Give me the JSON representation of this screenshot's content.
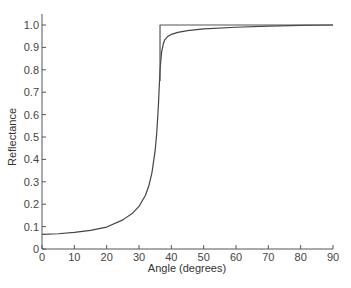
{
  "chart_data": {
    "type": "line",
    "title": "",
    "xlabel": "Angle (degrees)",
    "ylabel": "Reflectance",
    "xlim": [
      0,
      90
    ],
    "ylim": [
      0,
      1.05
    ],
    "grid": false,
    "legend": null,
    "x_ticks": [
      "0",
      "10",
      "20",
      "30",
      "40",
      "50",
      "60",
      "70",
      "80",
      "90"
    ],
    "y_ticks": [
      "0",
      "0.1",
      "0.2",
      "0.3",
      "0.4",
      "0.5",
      "0.6",
      "0.7",
      "0.8",
      "0.9",
      "1.0"
    ],
    "series": [
      {
        "name": "Reflectance (smooth)",
        "color": "#444444",
        "x": [
          0,
          5,
          10,
          15,
          20,
          25,
          28,
          30,
          32,
          33,
          34,
          35,
          35.5,
          36,
          36.5,
          37,
          37.5,
          38,
          39,
          40,
          42,
          45,
          50,
          60,
          70,
          80,
          90
        ],
        "y": [
          0.065,
          0.068,
          0.074,
          0.083,
          0.098,
          0.13,
          0.16,
          0.19,
          0.24,
          0.28,
          0.34,
          0.44,
          0.52,
          0.64,
          0.8,
          0.88,
          0.915,
          0.935,
          0.95,
          0.958,
          0.967,
          0.975,
          0.983,
          0.99,
          0.995,
          0.998,
          1.0
        ]
      },
      {
        "name": "Reflectance (ideal step)",
        "color": "#555555",
        "x": [
          36.5,
          36.5,
          90
        ],
        "y": [
          0.75,
          1.0,
          1.0
        ]
      }
    ]
  }
}
